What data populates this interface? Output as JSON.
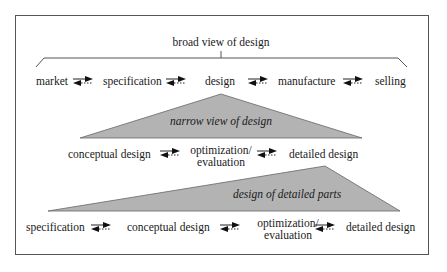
{
  "title": "broad view of design",
  "colors": {
    "triangle_fill": "#b3b3b3",
    "frame": "#555555",
    "text": "#1a1a1a"
  },
  "row1": {
    "items": [
      "market",
      "specification",
      "design",
      "manufacture",
      "selling"
    ]
  },
  "triangle1": {
    "label": "narrow view of design"
  },
  "row2": {
    "items": [
      "conceptual design",
      "optimization/",
      "evaluation",
      "detailed design"
    ]
  },
  "triangle2": {
    "label": "design of detailed parts"
  },
  "row3": {
    "items": [
      "specification",
      "conceptual design",
      "optimization/",
      "evaluation",
      "detailed design"
    ]
  },
  "arrow_icon": "bidirectional-iteration-arrows"
}
